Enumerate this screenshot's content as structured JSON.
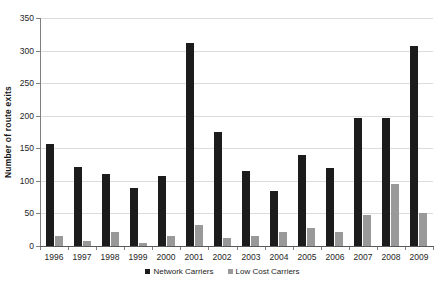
{
  "chart_data": {
    "type": "bar",
    "title": "",
    "xlabel": "",
    "ylabel": "Number of route exits",
    "ylim": [
      0,
      350
    ],
    "yticks": [
      0,
      50,
      100,
      150,
      200,
      250,
      300,
      350
    ],
    "grid": true,
    "legend_position": "bottom-center",
    "categories": [
      "1996",
      "1997",
      "1998",
      "1999",
      "2000",
      "2001",
      "2002",
      "2003",
      "2004",
      "2005",
      "2006",
      "2007",
      "2008",
      "2009"
    ],
    "series": [
      {
        "name": "Network Carriers",
        "color": "#1c1c1c",
        "values": [
          157,
          121,
          111,
          89,
          108,
          311,
          175,
          115,
          85,
          140,
          120,
          197,
          196,
          307
        ]
      },
      {
        "name": "Low Cost Carriers",
        "color": "#999999",
        "values": [
          16,
          8,
          22,
          4,
          15,
          32,
          12,
          15,
          21,
          27,
          21,
          47,
          95,
          50
        ]
      }
    ]
  },
  "style": {
    "background": "#ffffff",
    "gridline_color": "#dcdcdc",
    "axis_color": "#808080",
    "text_color": "#262626"
  }
}
